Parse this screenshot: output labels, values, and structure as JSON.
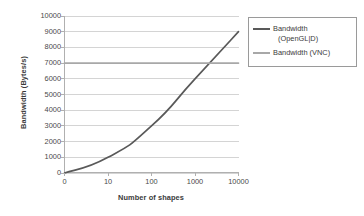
{
  "chart_data": {
    "type": "line",
    "title": "",
    "xlabel": "Number of shapes",
    "ylabel": "Bandwidth (Bytes/s)",
    "categories": [
      "0",
      "10",
      "100",
      "1000",
      "10000"
    ],
    "series": [
      {
        "name": "Bandwidth (OpenGL|D)",
        "name_line1": "Bandwidth",
        "name_line2": "(OpenGL|D)",
        "color": "#595959",
        "values": [
          0,
          1000,
          3000,
          6000,
          9000
        ]
      },
      {
        "name": "Bandwidth (VNC)",
        "name_line1": "Bandwidth (VNC)",
        "name_line2": "",
        "color": "#a8a8a8",
        "values": [
          7000,
          7000,
          7000,
          7000,
          7000
        ]
      }
    ],
    "ylim": [
      0,
      10000
    ],
    "ytick_step": 1000,
    "yticks": [
      "0",
      "1000",
      "2000",
      "3000",
      "4000",
      "5000",
      "6000",
      "7000",
      "8000",
      "9000",
      "10000"
    ],
    "grid": true,
    "grid_axis": "y",
    "grid_color": "#d4d4d4",
    "legend_position": "right",
    "legend_border": true,
    "plot_background": "#ffffff",
    "axis_color": "#b0b0b0"
  },
  "axes": {
    "y_title": "Bandwidth (Bytes/s)",
    "x_title": "Number of shapes"
  },
  "legend": {
    "entries": [
      {
        "line1": "Bandwidth",
        "line2": "(OpenGL|D)"
      },
      {
        "line1": "Bandwidth (VNC)",
        "line2": ""
      }
    ]
  }
}
